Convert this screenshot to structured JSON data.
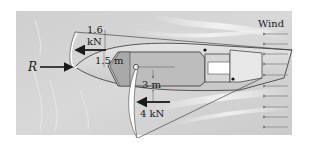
{
  "figure": {
    "background_color": "#d4d4d4",
    "panel_color": "#d0d0d0",
    "line_color": "#1a1a1a",
    "labels": {
      "reaction_force": "R",
      "top_force_value": "1.6",
      "top_force_unit": "kN",
      "vertical_dimension": "1.5 m",
      "horizontal_dimension": "3 m",
      "bottom_force": "4 kN",
      "wind": "Wind"
    },
    "forces": [
      {
        "name": "R",
        "direction": "right",
        "point": "nose"
      },
      {
        "name": "1.6 kN",
        "direction": "left",
        "offset": "1.5 m above axis"
      },
      {
        "name": "4 kN",
        "direction": "left",
        "offset": "3 m below axis"
      }
    ],
    "wind_arrow_count": 10
  }
}
